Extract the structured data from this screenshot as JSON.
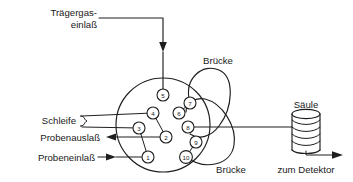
{
  "figure": {
    "title_text": "",
    "type": "schematic-diagram"
  },
  "colors": {
    "stroke": "#1e1e1e",
    "background": "#ffffff",
    "text": "#1a1a1a"
  },
  "labels": {
    "carrier_gas_line1": "Trägergas-",
    "carrier_gas_line2": "einlaß",
    "loop": "Schleife",
    "sample_outlet": "Probenauslaß",
    "sample_inlet": "Probeneinlaß",
    "bridge_top": "Brücke",
    "bridge_bottom": "Brücke",
    "column": "Säule",
    "to_detector": "zum Detektor"
  },
  "valve": {
    "ports": [
      {
        "number": "5",
        "cx": 163,
        "cy": 95
      },
      {
        "number": "7",
        "cx": 190,
        "cy": 103
      },
      {
        "number": "4",
        "cx": 153,
        "cy": 113
      },
      {
        "number": "6",
        "cx": 179,
        "cy": 113
      },
      {
        "number": "8",
        "cx": 188,
        "cy": 127
      },
      {
        "number": "3",
        "cx": 139,
        "cy": 128
      },
      {
        "number": "2",
        "cx": 166,
        "cy": 137
      },
      {
        "number": "9",
        "cx": 196,
        "cy": 142
      },
      {
        "number": "1",
        "cx": 148,
        "cy": 157
      },
      {
        "number": "10",
        "cx": 186,
        "cy": 157
      }
    ],
    "port_connections": [
      [
        "4",
        "2"
      ],
      [
        "3",
        "1"
      ],
      [
        "6",
        "7"
      ],
      [
        "9",
        "10"
      ]
    ]
  },
  "icons": {
    "arrow_down": "arrow-down-icon",
    "arrow_left": "arrow-left-icon",
    "arrow_right": "arrow-right-icon",
    "coil": "coil-column-icon"
  }
}
